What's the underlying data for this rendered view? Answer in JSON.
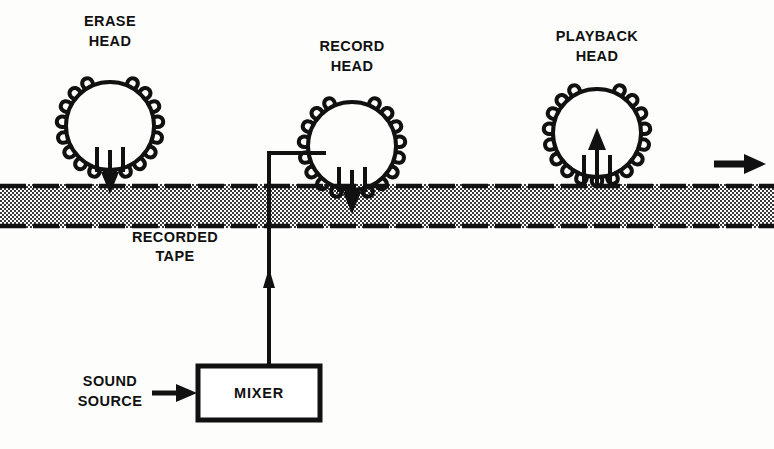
{
  "figure": {
    "background_color": "#fdfdfb",
    "ink_color": "#111111",
    "tape_fill_color": "#b8b8b8"
  },
  "heads": [
    {
      "id": "erase-head",
      "label_line1": "ERASE",
      "label_line2": "HEAD",
      "label_cx": 110,
      "label_y1": 22,
      "label_y2": 42,
      "cx": 110,
      "cy": 126,
      "r": 44,
      "coil_turns": 17,
      "flux_direction": "down",
      "arrow_label": "erase-flux-arrow"
    },
    {
      "id": "record-head",
      "label_line1": "RECORD",
      "label_line2": "HEAD",
      "label_cx": 352,
      "label_y1": 47,
      "label_y2": 67,
      "cx": 352,
      "cy": 146,
      "r": 44,
      "coil_turns": 17,
      "flux_direction": "down",
      "arrow_label": "record-flux-arrow"
    },
    {
      "id": "playback-head",
      "label_line1": "PLAYBACK",
      "label_line2": "HEAD",
      "label_cx": 597,
      "label_y1": 37,
      "label_y2": 57,
      "cx": 597,
      "cy": 133,
      "r": 44,
      "coil_turns": 17,
      "flux_direction": "up",
      "arrow_label": "playback-flux-arrow"
    }
  ],
  "tape": {
    "name": "recorded-tape-band",
    "label_line1": "RECORDED",
    "label_line2": "TAPE",
    "label_cx": 175,
    "label_y1": 238,
    "label_y2": 257,
    "x": 0,
    "y": 184,
    "width": 774,
    "height": 44,
    "travel_direction": "right"
  },
  "travel_arrow": {
    "name": "tape-travel-arrow",
    "x1": 716,
    "x2": 762,
    "y": 164
  },
  "mixer": {
    "name": "mixer-box",
    "label": "MIXER",
    "x": 198,
    "y": 366,
    "width": 122,
    "height": 54
  },
  "sound_source": {
    "name": "sound-source-label",
    "label_line1": "SOUND",
    "label_line2": "SOURCE",
    "label_cx": 110,
    "label_y1": 382,
    "label_y2": 402,
    "arrow_x1": 152,
    "arrow_x2": 196,
    "arrow_y": 393
  },
  "signal_wire": {
    "name": "mixer-to-record-head-wire",
    "from": "mixer",
    "to": "record-head",
    "vertical_x": 269,
    "bottom_y": 366,
    "top_y": 152,
    "elbow_x": 320,
    "arrow_y": 280
  }
}
